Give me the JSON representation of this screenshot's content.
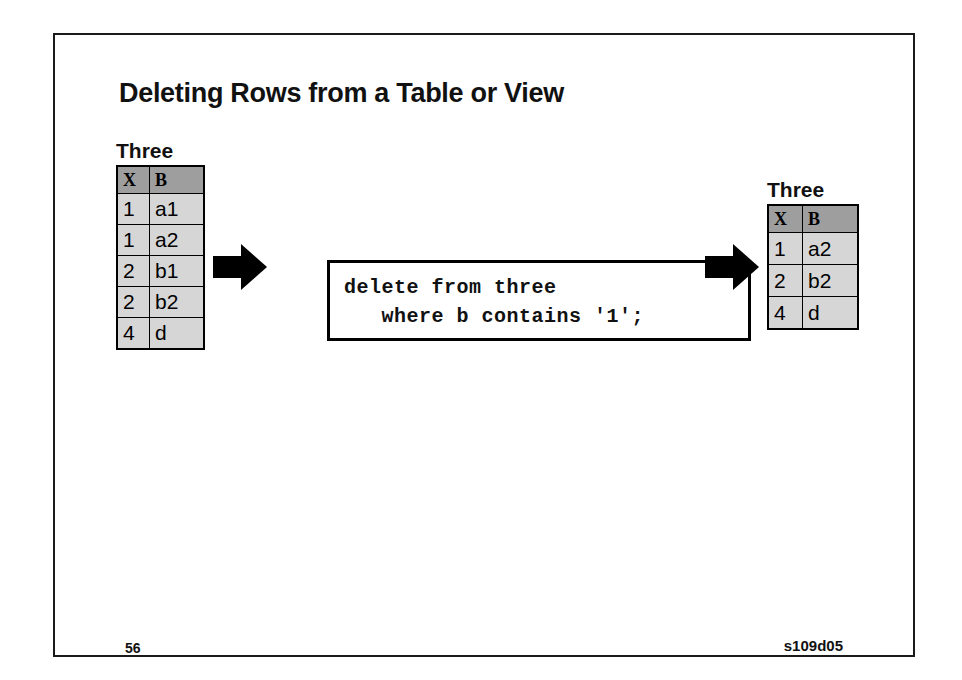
{
  "slide": {
    "title": "Deleting Rows from a Table or View",
    "page_number": "56",
    "slide_code": "s109d05",
    "border_color": "#1a1a1a",
    "background": "#ffffff"
  },
  "tables": {
    "before": {
      "caption": "Three",
      "columns": [
        "X",
        "B"
      ],
      "rows": [
        [
          "1",
          "a1"
        ],
        [
          "1",
          "a2"
        ],
        [
          "2",
          "b1"
        ],
        [
          "2",
          "b2"
        ],
        [
          "4",
          "d"
        ]
      ]
    },
    "after": {
      "caption": "Three",
      "columns": [
        "X",
        "B"
      ],
      "rows": [
        [
          "1",
          "a2"
        ],
        [
          "2",
          "b2"
        ],
        [
          "4",
          "d"
        ]
      ]
    },
    "header_fill": "#9e9e9e",
    "cell_fill": "#d6d6d6"
  },
  "sql": {
    "line1": "delete from three",
    "line2": "   where b contains '1';",
    "code": "delete from three\n   where b contains '1';"
  },
  "arrows": {
    "left": "right-arrow",
    "right": "right-arrow"
  }
}
